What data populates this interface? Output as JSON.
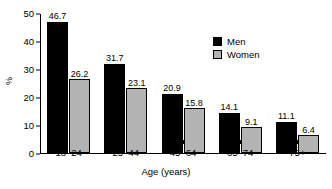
{
  "chart_data": {
    "type": "bar",
    "title": "",
    "xlabel": "Age (years)",
    "ylabel": "%",
    "ylim": [
      0,
      50
    ],
    "yticks": [
      0,
      10,
      20,
      30,
      40,
      50
    ],
    "grid": false,
    "legend_position": "upper-right-inside",
    "categories": [
      "18–24",
      "25–44",
      "45–64",
      "65–74",
      "75+"
    ],
    "series": [
      {
        "name": "Men",
        "color": "#000000",
        "values": [
          46.7,
          31.7,
          20.9,
          14.1,
          11.1
        ],
        "labels": [
          "46.7",
          "31.7",
          "20.9",
          "14.1",
          "11.1"
        ]
      },
      {
        "name": "Women",
        "color": "#b3b3b3",
        "values": [
          26.2,
          23.1,
          15.8,
          9.1,
          6.4
        ],
        "labels": [
          "26.2",
          "23.1",
          "15.8",
          "9.1",
          "6.4"
        ]
      }
    ]
  },
  "legend": {
    "items": [
      {
        "label": "Men",
        "swatch": "men"
      },
      {
        "label": "Women",
        "swatch": "women"
      }
    ]
  }
}
